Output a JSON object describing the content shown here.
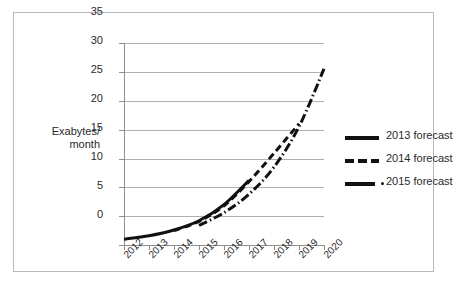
{
  "chart_data": {
    "type": "line",
    "title": "",
    "xlabel": "",
    "ylabel": "Exabytes/ month",
    "ylabel_lines": [
      "Exabytes/",
      "month"
    ],
    "ylim": [
      0,
      35
    ],
    "yticks": [
      0,
      5,
      10,
      15,
      20,
      25,
      30,
      35
    ],
    "ytick_labels": [
      "0",
      "5",
      "10",
      "15",
      "20",
      "25",
      "30",
      "35"
    ],
    "categories": [
      "2012",
      "2013",
      "2014",
      "2015",
      "2016",
      "2017",
      "2018",
      "2019",
      "2020"
    ],
    "x": [
      2012,
      2013,
      2014,
      2015,
      2016,
      2017,
      2018,
      2019,
      2020
    ],
    "grid": true,
    "legend_position": "right",
    "series": [
      {
        "name": "2013 forecast",
        "style": "solid",
        "color": "#111111",
        "x": [
          2012,
          2013,
          2014,
          2015,
          2016,
          2017
        ],
        "values": [
          1.0,
          1.6,
          2.6,
          4.2,
          7.0,
          11.2
        ]
      },
      {
        "name": "2014 forecast",
        "style": "dashed",
        "color": "#111111",
        "x": [
          2014,
          2015,
          2016,
          2017,
          2018,
          2019
        ],
        "values": [
          2.5,
          4.1,
          6.8,
          11.0,
          15.9,
          21.0
        ]
      },
      {
        "name": "2015 forecast",
        "style": "dash-dot",
        "color": "#111111",
        "x": [
          2015,
          2016,
          2017,
          2018,
          2019,
          2020
        ],
        "values": [
          3.4,
          5.6,
          8.8,
          13.5,
          20.5,
          30.5
        ]
      }
    ]
  },
  "axis": {
    "y_title_line1": "Exabytes/",
    "y_title_line2": "month",
    "ytick_0": "0",
    "ytick_1": "5",
    "ytick_2": "10",
    "ytick_3": "15",
    "ytick_4": "20",
    "ytick_5": "25",
    "ytick_6": "30",
    "ytick_7": "35",
    "xtick_0": "2012",
    "xtick_1": "2013",
    "xtick_2": "2014",
    "xtick_3": "2015",
    "xtick_4": "2016",
    "xtick_5": "2017",
    "xtick_6": "2018",
    "xtick_7": "2019",
    "xtick_8": "2020"
  },
  "legend": {
    "items": [
      {
        "label": "2013 forecast",
        "style": "solid"
      },
      {
        "label": "2014 forecast",
        "style": "dashed"
      },
      {
        "label": "2015 forecast",
        "style": "dash-dot"
      }
    ]
  },
  "colors": {
    "line": "#111111",
    "grid": "#b0b0b0",
    "axis": "#8f8f8f",
    "frame": "#b9b9b9",
    "background": "#ffffff",
    "text": "#2a2a2a"
  }
}
